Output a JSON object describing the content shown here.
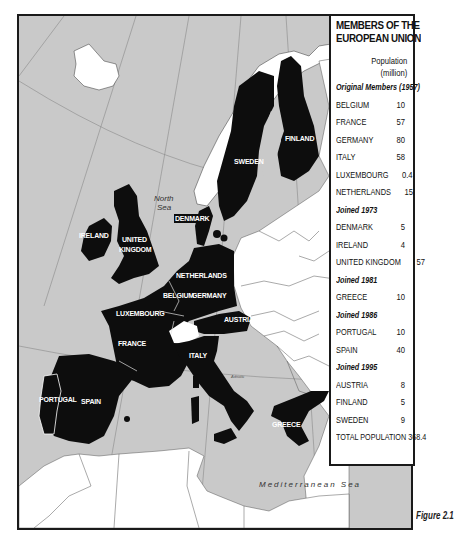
{
  "legend": {
    "title_line1": "MEMBERS OF THE",
    "title_line2": "EUROPEAN UNION",
    "population_header_line1": "Population",
    "population_header_line2": "(million)",
    "groups": [
      {
        "label": "Original Members (1957)",
        "members": [
          {
            "name": "BELGIUM",
            "population": "10"
          },
          {
            "name": "FRANCE",
            "population": "57"
          },
          {
            "name": "GERMANY",
            "population": "80"
          },
          {
            "name": "ITALY",
            "population": "58"
          },
          {
            "name": "LUXEMBOURG",
            "population": "0.4"
          },
          {
            "name": "NETHERLANDS",
            "population": "15"
          }
        ]
      },
      {
        "label": "Joined 1973",
        "members": [
          {
            "name": "DENMARK",
            "population": "5"
          },
          {
            "name": "IRELAND",
            "population": "4"
          },
          {
            "name": "UNITED KINGDOM",
            "population": "57"
          }
        ]
      },
      {
        "label": "Joined 1981",
        "members": [
          {
            "name": "GREECE",
            "population": "10"
          }
        ]
      },
      {
        "label": "Joined 1986",
        "members": [
          {
            "name": "PORTUGAL",
            "population": "10"
          },
          {
            "name": "SPAIN",
            "population": "40"
          }
        ]
      },
      {
        "label": "Joined 1995",
        "members": [
          {
            "name": "AUSTRIA",
            "population": "8"
          },
          {
            "name": "FINLAND",
            "population": "5"
          },
          {
            "name": "SWEDEN",
            "population": "9"
          }
        ]
      }
    ],
    "total": "TOTAL POPULATION 368.4"
  },
  "map": {
    "colors": {
      "sea": "#c9c9c9",
      "member": "#0d0d0d",
      "non_member": "#ffffff",
      "border": "#1a1a1a"
    },
    "country_labels": {
      "finland": "FINLAND",
      "sweden": "SWEDEN",
      "denmark": "DENMARK",
      "ireland": "IRELAND",
      "uk_line1": "UNITED",
      "uk_line2": "KINGDOM",
      "netherlands": "NETHERLANDS",
      "belgium": "BELGIUM",
      "germany": "GERMANY",
      "luxembourg": "LUXEMBOURG",
      "france": "FRANCE",
      "austria": "AUSTRIA",
      "italy": "ITALY",
      "portugal": "PORTUGAL",
      "spain": "SPAIN",
      "greece": "GREECE"
    },
    "sea_labels": {
      "north_sea_line1": "North",
      "north_sea_line2": "Sea",
      "adriatic": "Adriatic",
      "mediterranean": "Mediterranean Sea"
    }
  },
  "caption": "Figure 2.1"
}
